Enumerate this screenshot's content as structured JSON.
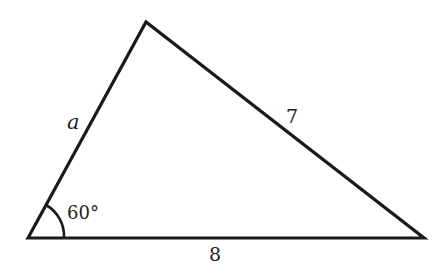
{
  "diagram": {
    "type": "triangle",
    "stroke_color": "#1a1a1a",
    "vertices": {
      "bottom_left": [
        28,
        238
      ],
      "apex": [
        146,
        22
      ],
      "bottom_right": [
        424,
        238
      ]
    },
    "sides": {
      "left": {
        "label": "a"
      },
      "right": {
        "label": "7"
      },
      "bottom": {
        "label": "8"
      }
    },
    "angle": {
      "vertex": "bottom_left",
      "label": "60°"
    }
  }
}
